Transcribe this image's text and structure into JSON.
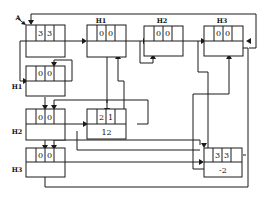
{
  "diagram": {
    "entry_label": "A",
    "nodes": [
      {
        "id": "root",
        "label": "",
        "cells": [
          "3",
          "3"
        ],
        "value": ""
      },
      {
        "id": "top_h1",
        "label": "H1",
        "cells": [
          "0",
          "0"
        ],
        "value": ""
      },
      {
        "id": "top_h2",
        "label": "H2",
        "cells": [
          "0",
          "0"
        ],
        "value": ""
      },
      {
        "id": "top_h3",
        "label": "H3",
        "cells": [
          "0",
          "0"
        ],
        "value": ""
      },
      {
        "id": "left_h1",
        "label": "H1",
        "cells": [
          "0",
          "0"
        ],
        "value": ""
      },
      {
        "id": "left_h2",
        "label": "H2",
        "cells": [
          "0",
          "0"
        ],
        "value": ""
      },
      {
        "id": "left_h3",
        "label": "H3",
        "cells": [
          "0",
          "0"
        ],
        "value": ""
      },
      {
        "id": "mid",
        "label": "",
        "cells": [
          "2",
          "1"
        ],
        "value": "12"
      },
      {
        "id": "bottom_right",
        "label": "",
        "cells": [
          "3",
          "3"
        ],
        "value": "-2"
      }
    ],
    "colors": {
      "line": "#1a1a1a",
      "background": "#ffffff"
    }
  }
}
